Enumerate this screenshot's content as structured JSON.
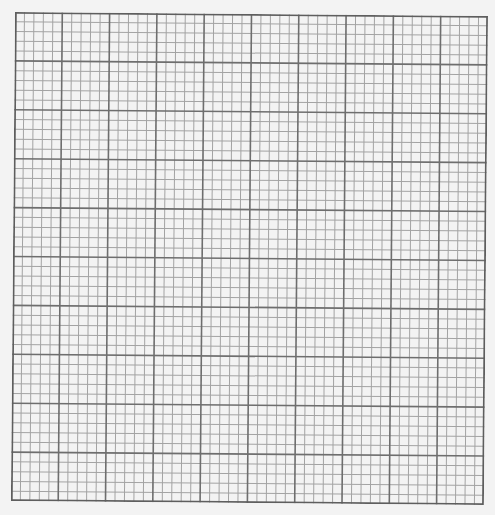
{
  "graph_paper": {
    "major_columns": 10,
    "major_rows": 10,
    "minor_per_major": 5,
    "background_color": "#f3f3f3",
    "minor_line_color": "#a3a3a3",
    "major_line_color": "#6e6e6e",
    "border_color": "#5e5e5e"
  }
}
